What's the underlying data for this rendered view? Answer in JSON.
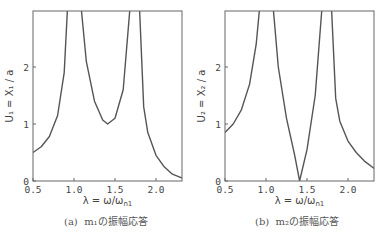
{
  "chart_data": [
    {
      "type": "line",
      "title": "",
      "caption": "(a)  m₁の振幅応答",
      "xlabel": "λ = ω/ω_n1",
      "ylabel": "U₁ = X₁/a",
      "xlim": [
        0.5,
        2.32
      ],
      "ylim": [
        0,
        3.0
      ],
      "xticks": [
        "0.5",
        "1.0",
        "1.5",
        "2.0"
      ],
      "yticks": [
        "0",
        "1",
        "2"
      ],
      "grid": false,
      "series": [
        {
          "name": "U1",
          "x": [
            0.5,
            0.6,
            0.7,
            0.8,
            0.88,
            0.92,
            1.09,
            1.15,
            1.25,
            1.35,
            1.41,
            1.5,
            1.6,
            1.68,
            1.8,
            1.85,
            1.9,
            2.0,
            2.1,
            2.2,
            2.32
          ],
          "y": [
            0.5,
            0.6,
            0.78,
            1.15,
            1.9,
            3.0,
            3.0,
            2.1,
            1.4,
            1.07,
            1.0,
            1.1,
            1.6,
            3.0,
            3.0,
            1.3,
            0.85,
            0.45,
            0.25,
            0.12,
            0.05
          ]
        }
      ]
    },
    {
      "type": "line",
      "title": "",
      "caption": "(b)  m₂の振幅応答",
      "xlabel": "λ = ω/ω_n1",
      "ylabel": "U₂ = X₂/a",
      "xlim": [
        0.5,
        2.32
      ],
      "ylim": [
        0,
        3.0
      ],
      "xticks": [
        "0.5",
        "1.0",
        "1.5",
        "2.0"
      ],
      "yticks": [
        "0",
        "1",
        "2"
      ],
      "grid": false,
      "series": [
        {
          "name": "U2",
          "x": [
            0.5,
            0.6,
            0.7,
            0.8,
            0.88,
            0.92,
            1.09,
            1.15,
            1.25,
            1.35,
            1.41,
            1.5,
            1.6,
            1.68,
            1.8,
            1.85,
            1.9,
            2.0,
            2.1,
            2.2,
            2.32
          ],
          "y": [
            0.85,
            1.0,
            1.25,
            1.7,
            2.4,
            3.0,
            3.0,
            2.0,
            1.1,
            0.45,
            0.0,
            0.55,
            1.5,
            3.0,
            3.0,
            1.45,
            1.05,
            0.7,
            0.5,
            0.35,
            0.22
          ]
        }
      ]
    }
  ],
  "panels": [
    {
      "ylabel": "U₁ = X₁ / a",
      "xlabel": "λ = ω/ω",
      "xlabel_sub": "n1",
      "caption_letter": "(a)",
      "caption_text": "m₁の振幅応答"
    },
    {
      "ylabel": "U₂ = X₂ / a",
      "xlabel": "λ = ω/ω",
      "xlabel_sub": "n1",
      "caption_letter": "(b)",
      "caption_text": "m₂の振幅応答"
    }
  ]
}
